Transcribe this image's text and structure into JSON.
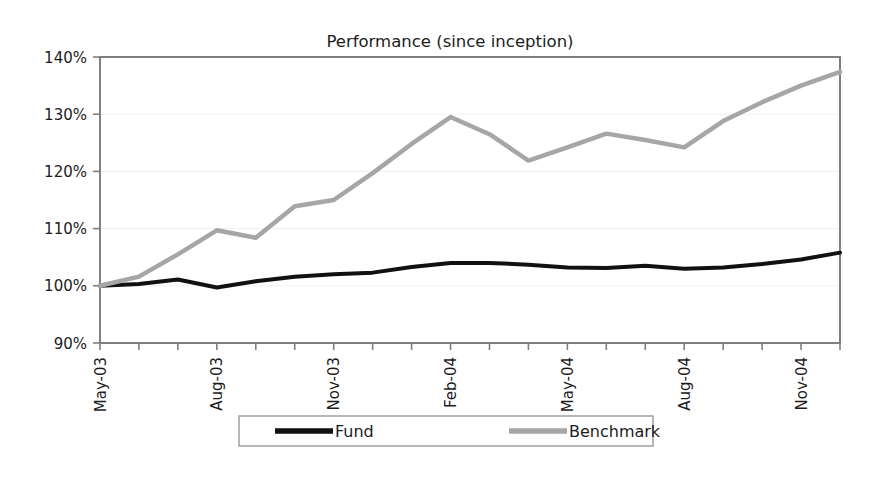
{
  "chart_data": {
    "type": "line",
    "title": "Performance (since inception)",
    "xlabel": "",
    "ylabel": "",
    "ylim": [
      90,
      140
    ],
    "ytick_values": [
      90,
      100,
      110,
      120,
      130,
      140
    ],
    "ytick_labels": [
      "90%",
      "100%",
      "110%",
      "120%",
      "130%",
      "140%"
    ],
    "grid": "horizontal-faint",
    "legend_position": "bottom",
    "x": [
      "May-03",
      "Jun-03",
      "Jul-03",
      "Aug-03",
      "Sep-03",
      "Oct-03",
      "Nov-03",
      "Dec-03",
      "Jan-04",
      "Feb-04",
      "Mar-04",
      "Apr-04",
      "May-04",
      "Jun-04",
      "Jul-04",
      "Aug-04",
      "Sep-04",
      "Oct-04",
      "Nov-04",
      "Dec-04"
    ],
    "xtick_labels": [
      "May-03",
      "Aug-03",
      "Nov-03",
      "Feb-04",
      "May-04",
      "Aug-04",
      "Nov-04"
    ],
    "xtick_indices": [
      0,
      3,
      6,
      9,
      12,
      15,
      18
    ],
    "series": [
      {
        "name": "Fund",
        "color": "#111111",
        "linewidth": 4.0,
        "values": [
          100.0,
          100.3,
          101.1,
          99.7,
          100.8,
          101.6,
          102.0,
          102.3,
          103.3,
          104.0,
          104.0,
          103.7,
          103.2,
          103.1,
          103.5,
          103.0,
          103.2,
          103.8,
          104.6,
          105.8
        ]
      },
      {
        "name": "Benchmark",
        "color": "#a6a6a6",
        "linewidth": 4.5,
        "values": [
          100.0,
          101.6,
          105.5,
          109.7,
          108.4,
          113.9,
          115.0,
          119.7,
          124.8,
          129.5,
          126.5,
          121.9,
          124.2,
          126.6,
          125.5,
          124.2,
          128.8,
          132.1,
          135.0,
          137.4
        ]
      }
    ]
  },
  "legend": {
    "items": [
      {
        "label": "Fund",
        "color": "#111111"
      },
      {
        "label": "Benchmark",
        "color": "#a6a6a6"
      }
    ]
  },
  "colors": {
    "fund": "#111111",
    "benchmark": "#a6a6a6",
    "axis": "#808080",
    "grid": "#f0f0f0",
    "text": "#1c1c1c",
    "background": "#ffffff"
  }
}
